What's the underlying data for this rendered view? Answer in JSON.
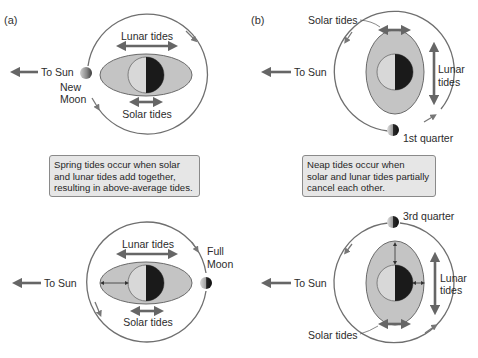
{
  "panels": {
    "a": {
      "label": "(a)",
      "top": {
        "to_sun": "To Sun",
        "lunar_tides": "Lunar tides",
        "solar_tides": "Solar tides",
        "moon_phase_line1": "New",
        "moon_phase_line2": "Moon"
      },
      "caption": {
        "lines": [
          "Spring tides occur when solar",
          "and lunar tides add together,",
          "resulting in above-average tides."
        ]
      },
      "bottom": {
        "to_sun": "To Sun",
        "lunar_tides": "Lunar tides",
        "solar_tides": "Solar tides",
        "moon_phase_line1": "Full",
        "moon_phase_line2": "Moon"
      }
    },
    "b": {
      "label": "(b)",
      "top": {
        "to_sun": "To Sun",
        "solar_tides": "Solar tides",
        "lunar_tides_line1": "Lunar",
        "lunar_tides_line2": "tides",
        "moon_phase": "1st quarter"
      },
      "caption": {
        "lines": [
          "Neap tides occur when",
          "solar and lunar tides partially",
          "cancel each other."
        ]
      },
      "bottom": {
        "to_sun": "To Sun",
        "solar_tides": "Solar tides",
        "lunar_tides_line1": "Lunar",
        "lunar_tides_line2": "tides",
        "moon_phase": "3rd quarter"
      }
    }
  },
  "colors": {
    "orbit": "#6f6f6f",
    "arrow": "#6a6a6a",
    "tidal_bulge": "#c4c4c4",
    "earth_light": "#d8d8d8",
    "earth_dark": "#1a1a1a",
    "caption_bg": "#e6e6e6"
  }
}
